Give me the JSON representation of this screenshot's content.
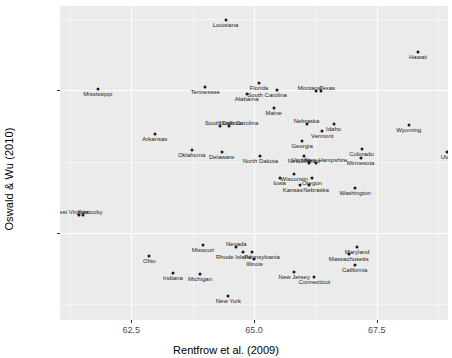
{
  "chart_data": {
    "type": "scatter",
    "title": "",
    "xlabel": "Rentfrow et al. (2009)",
    "ylabel": "Oswald & Wu (2010)",
    "xlim": [
      61.05,
      68.95
    ],
    "ylim": [
      -0.0805,
      0.0295
    ],
    "xticks": [
      62.5,
      65.0,
      67.5
    ],
    "xticklabels": [
      "62.5",
      "65.0",
      "67.5"
    ],
    "yticks": [
      0.0,
      -0.05
    ],
    "yticklabels": [
      "0.00",
      "-0.05"
    ],
    "grid": true,
    "legend": null,
    "point_labels": true,
    "points": [
      {
        "label": "Louisiana",
        "x": 64.42,
        "y": 0.0245
      },
      {
        "label": "Hawaii",
        "x": 68.34,
        "y": 0.0135
      },
      {
        "label": "Mississippi",
        "x": 61.82,
        "y": 0.0003
      },
      {
        "label": "Tennessee",
        "x": 64.01,
        "y": 0.001
      },
      {
        "label": "Florida",
        "x": 65.1,
        "y": 0.0024
      },
      {
        "label": "South Carolina",
        "x": 65.47,
        "y": 0.0
      },
      {
        "label": "Alabama",
        "x": 64.85,
        "y": -0.0014
      },
      {
        "label": "Texas",
        "x": 66.37,
        "y": -0.0002
      },
      {
        "label": "Montana",
        "x": 66.27,
        "y": -0.0002
      },
      {
        "label": "Maine",
        "x": 65.4,
        "y": -0.0063
      },
      {
        "label": "South Dakota",
        "x": 64.31,
        "y": -0.0124
      },
      {
        "label": "North Carolina",
        "x": 64.49,
        "y": -0.0124
      },
      {
        "label": "Utah",
        "x": 68.93,
        "y": -0.0215
      },
      {
        "label": "Wyoming",
        "x": 68.15,
        "y": -0.0122
      },
      {
        "label": "Nebraska",
        "x": 66.07,
        "y": -0.012
      },
      {
        "label": "Idaho",
        "x": 66.62,
        "y": -0.012
      },
      {
        "label": "Vermont",
        "x": 66.39,
        "y": -0.0144
      },
      {
        "label": "Arkansas",
        "x": 62.98,
        "y": -0.0152
      },
      {
        "label": "Georgia",
        "x": 65.98,
        "y": -0.0177
      },
      {
        "label": "Colorado",
        "x": 67.19,
        "y": -0.0206
      },
      {
        "label": "Oklahoma",
        "x": 63.73,
        "y": -0.0208
      },
      {
        "label": "Delaware",
        "x": 64.34,
        "y": -0.0218
      },
      {
        "label": "North Dakota",
        "x": 65.13,
        "y": -0.0232
      },
      {
        "label": "New Mexico",
        "x": 66.02,
        "y": -0.0232
      },
      {
        "label": "Minnesota",
        "x": 67.17,
        "y": -0.0239
      },
      {
        "label": "Virginia",
        "x": 66.13,
        "y": -0.0255
      },
      {
        "label": "New Hampshire",
        "x": 66.26,
        "y": -0.0255
      },
      {
        "label": "Wisconsin",
        "x": 65.82,
        "y": -0.0293
      },
      {
        "label": "Iowa",
        "x": 65.52,
        "y": -0.0308
      },
      {
        "label": "Oregon",
        "x": 66.18,
        "y": -0.0309
      },
      {
        "label": "Kansas",
        "x": 65.93,
        "y": -0.0331
      },
      {
        "label": "Nebraska2",
        "x": 66.12,
        "y": -0.0331
      },
      {
        "label": "Washington",
        "x": 67.06,
        "y": -0.0344
      },
      {
        "label": "West Virginia",
        "x": 61.44,
        "y": -0.0437
      },
      {
        "label": "Kentucky",
        "x": 61.52,
        "y": -0.0437
      },
      {
        "label": "Missouri",
        "x": 63.96,
        "y": -0.0541
      },
      {
        "label": "Nevada",
        "x": 64.64,
        "y": -0.0551
      },
      {
        "label": "Maryland",
        "x": 67.1,
        "y": -0.0551
      },
      {
        "label": "Rhode Island",
        "x": 64.77,
        "y": -0.0567
      },
      {
        "label": "Pennsylvania",
        "x": 64.96,
        "y": -0.0567
      },
      {
        "label": "Massachusetts",
        "x": 66.93,
        "y": -0.0573
      },
      {
        "label": "Ohio",
        "x": 62.87,
        "y": -0.0581
      },
      {
        "label": "Illinois",
        "x": 65.01,
        "y": -0.0592
      },
      {
        "label": "California",
        "x": 67.05,
        "y": -0.0614
      },
      {
        "label": "Indiana",
        "x": 63.35,
        "y": -0.0639
      },
      {
        "label": "Michigan",
        "x": 63.9,
        "y": -0.0644
      },
      {
        "label": "New Jersey",
        "x": 65.82,
        "y": -0.0636
      },
      {
        "label": "Connecticut",
        "x": 66.23,
        "y": -0.0654
      },
      {
        "label": "New York",
        "x": 64.48,
        "y": -0.0722
      }
    ]
  },
  "display_labels": {
    "Nebraska2": "Nebraska"
  },
  "label_offsets": {
    "South Carolina": {
      "dx": -10,
      "dy": 1
    },
    "Texas": {
      "dx": 6,
      "dy": -7
    },
    "Montana": {
      "dx": -7,
      "dy": -7
    },
    "South Dakota": {
      "dx": 3,
      "dy": -7
    },
    "North Carolina": {
      "dx": 10,
      "dy": -7
    },
    "Nebraska": {
      "dx": 0,
      "dy": -7
    },
    "Virginia": {
      "dx": -8,
      "dy": -7
    },
    "New Hampshire": {
      "dx": 10,
      "dy": -7
    },
    "Kansas": {
      "dx": -7,
      "dy": 1
    },
    "Nebraska2": {
      "dx": 7,
      "dy": 1
    },
    "West Virginia": {
      "dx": -8,
      "dy": -7
    },
    "Kentucky": {
      "dx": 7,
      "dy": -7
    },
    "Rhode Island": {
      "dx": -9,
      "dy": 1
    },
    "Pennsylvania": {
      "dx": 10,
      "dy": 1
    },
    "Nevada": {
      "dx": 0,
      "dy": -7
    }
  }
}
